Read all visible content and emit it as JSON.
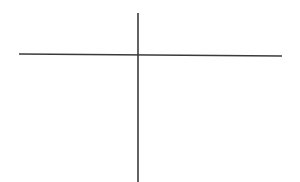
{
  "diagram": {
    "background": "#ffffff",
    "stroke_color": "#3a3a3a",
    "stroke_width": 1.6,
    "lines": [
      {
        "id": "horizontal-axis",
        "x1": 19,
        "y1": 54,
        "x2": 282,
        "y2": 56
      },
      {
        "id": "vertical-axis",
        "x1": 138,
        "y1": 13,
        "x2": 138,
        "y2": 182
      }
    ]
  }
}
